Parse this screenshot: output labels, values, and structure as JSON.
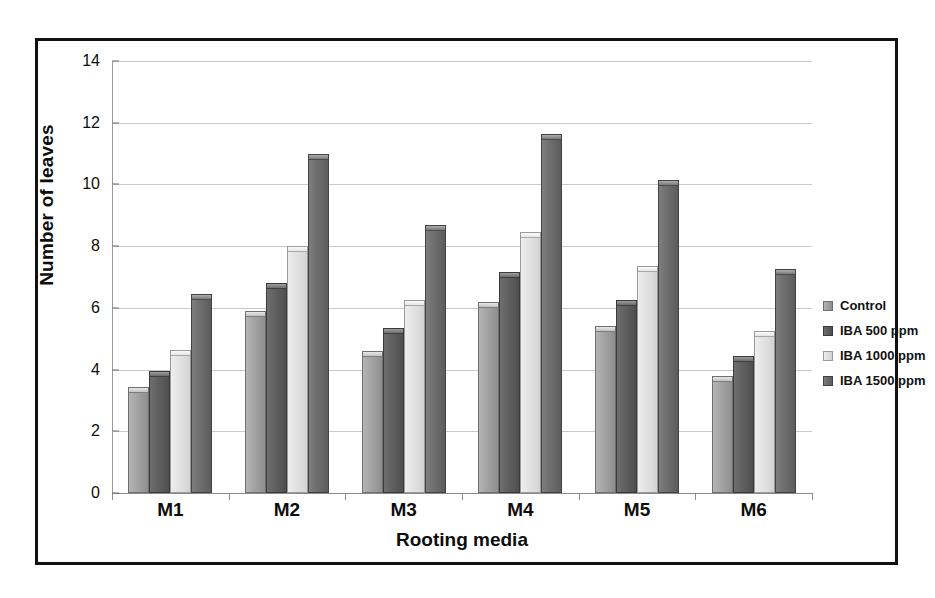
{
  "chart_data": {
    "type": "bar",
    "title": "",
    "xlabel": "Rooting media",
    "ylabel": "Number of leaves",
    "categories": [
      "M1",
      "M2",
      "M3",
      "M4",
      "M5",
      "M6"
    ],
    "ylim": [
      0,
      14
    ],
    "yticks": [
      0,
      2,
      4,
      6,
      8,
      10,
      12,
      14
    ],
    "ytick_labels": [
      "0",
      "2",
      "4",
      "6",
      "8",
      "10",
      "12",
      "14"
    ],
    "grid": true,
    "legend_position": "right",
    "series": [
      {
        "name": "Control",
        "color": "#a3a3a3",
        "values": [
          3.45,
          5.9,
          4.6,
          6.2,
          5.4,
          3.8
        ]
      },
      {
        "name": "IBA 500 ppm",
        "color": "#5e5e5e",
        "values": [
          3.95,
          6.8,
          5.35,
          7.15,
          6.25,
          4.45
        ]
      },
      {
        "name": "IBA 1000 ppm",
        "color": "#e2e2e2",
        "values": [
          4.65,
          8.0,
          6.25,
          8.45,
          7.35,
          5.25
        ]
      },
      {
        "name": "IBA 1500 ppm",
        "color": "#6c6c6c",
        "values": [
          6.45,
          11.0,
          8.7,
          11.65,
          10.15,
          7.25
        ]
      }
    ]
  },
  "legend": {
    "items": [
      {
        "label": "Control"
      },
      {
        "label": "IBA 500 ppm"
      },
      {
        "label": "IBA 1000 ppm"
      },
      {
        "label": "IBA 1500 ppm"
      }
    ]
  },
  "frame": {
    "border_color": "#111111",
    "background": "#ffffff"
  }
}
